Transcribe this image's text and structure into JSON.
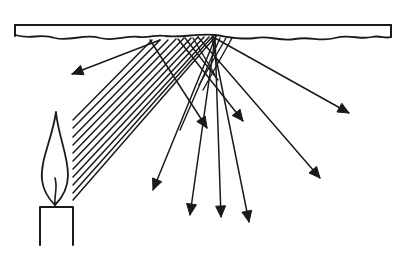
{
  "diagram": {
    "colors": {
      "ink": "#1a1a1a",
      "background": "#ffffff"
    },
    "surface": {
      "label": "rough-reflecting-surface",
      "x1": 15,
      "x2": 391,
      "top": 25,
      "wavy_bottom": "M15,35 C30,40 40,33 55,38 C70,42 85,33 100,38 C115,42 125,35 140,37 C150,38 158,34 165,36 C180,38 200,33 215,35 C230,37 240,40 255,38 C270,35 280,42 295,39 C310,36 320,42 335,38 C350,34 360,40 372,37 C380,35 385,39 391,37"
    },
    "candle": {
      "body": {
        "left": 40,
        "right": 73,
        "top": 207,
        "bottom": 245
      },
      "flame": "M56,112 C52,140 40,160 42,180 C44,195 52,202 55,205 C60,200 68,190 68,175 C68,155 58,135 56,112 Z",
      "wick": "M55,205 C54,195 58,188 55,178"
    },
    "incident_rays": [
      {
        "x1": 73,
        "y1": 120,
        "x2": 152,
        "y2": 40
      },
      {
        "x1": 73,
        "y1": 128,
        "x2": 160,
        "y2": 40
      },
      {
        "x1": 73,
        "y1": 137,
        "x2": 168,
        "y2": 40
      },
      {
        "x1": 73,
        "y1": 145,
        "x2": 176,
        "y2": 39
      },
      {
        "x1": 73,
        "y1": 153,
        "x2": 184,
        "y2": 38
      },
      {
        "x1": 73,
        "y1": 161,
        "x2": 191,
        "y2": 38
      },
      {
        "x1": 73,
        "y1": 169,
        "x2": 198,
        "y2": 37
      },
      {
        "x1": 73,
        "y1": 177,
        "x2": 204,
        "y2": 37
      },
      {
        "x1": 73,
        "y1": 185,
        "x2": 209,
        "y2": 37
      },
      {
        "x1": 73,
        "y1": 193,
        "x2": 213,
        "y2": 36
      },
      {
        "x1": 73,
        "y1": 200,
        "x2": 216,
        "y2": 36
      }
    ],
    "reflected_rays": [
      {
        "x1": 160,
        "y1": 40,
        "x2": 72,
        "y2": 74
      },
      {
        "x1": 150,
        "y1": 40,
        "x2": 207,
        "y2": 128
      },
      {
        "x1": 178,
        "y1": 39,
        "x2": 243,
        "y2": 121
      },
      {
        "x1": 213,
        "y1": 37,
        "x2": 349,
        "y2": 113
      },
      {
        "x1": 198,
        "y1": 37,
        "x2": 320,
        "y2": 178
      },
      {
        "x1": 216,
        "y1": 36,
        "x2": 153,
        "y2": 190
      },
      {
        "x1": 215,
        "y1": 38,
        "x2": 190,
        "y2": 215
      },
      {
        "x1": 215,
        "y1": 38,
        "x2": 221,
        "y2": 217
      },
      {
        "x1": 212,
        "y1": 38,
        "x2": 249,
        "y2": 222
      }
    ],
    "scatter_cross_lines": [
      {
        "x1": 185,
        "y1": 38,
        "x2": 218,
        "y2": 80
      },
      {
        "x1": 193,
        "y1": 38,
        "x2": 215,
        "y2": 75
      },
      {
        "x1": 232,
        "y1": 38,
        "x2": 203,
        "y2": 90
      },
      {
        "x1": 226,
        "y1": 38,
        "x2": 199,
        "y2": 85
      },
      {
        "x1": 220,
        "y1": 38,
        "x2": 180,
        "y2": 130
      }
    ]
  }
}
